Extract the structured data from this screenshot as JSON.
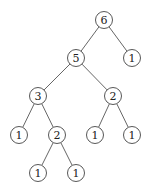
{
  "diagram": {
    "type": "tree",
    "nodes": [
      {
        "id": "n0",
        "label": "6",
        "x": 104,
        "y": 20
      },
      {
        "id": "n1",
        "label": "5",
        "x": 76,
        "y": 58
      },
      {
        "id": "n2",
        "label": "1",
        "x": 132,
        "y": 58
      },
      {
        "id": "n3",
        "label": "3",
        "x": 38,
        "y": 96
      },
      {
        "id": "n4",
        "label": "2",
        "x": 113,
        "y": 96
      },
      {
        "id": "n5",
        "label": "1",
        "x": 19,
        "y": 135
      },
      {
        "id": "n6",
        "label": "2",
        "x": 57,
        "y": 135
      },
      {
        "id": "n7",
        "label": "1",
        "x": 95,
        "y": 135
      },
      {
        "id": "n8",
        "label": "1",
        "x": 132,
        "y": 135
      },
      {
        "id": "n9",
        "label": "1",
        "x": 38,
        "y": 173
      },
      {
        "id": "n10",
        "label": "1",
        "x": 76,
        "y": 173
      }
    ],
    "edges": [
      [
        "n0",
        "n1"
      ],
      [
        "n0",
        "n2"
      ],
      [
        "n1",
        "n3"
      ],
      [
        "n1",
        "n4"
      ],
      [
        "n3",
        "n5"
      ],
      [
        "n3",
        "n6"
      ],
      [
        "n4",
        "n7"
      ],
      [
        "n4",
        "n8"
      ],
      [
        "n6",
        "n9"
      ],
      [
        "n6",
        "n10"
      ]
    ],
    "node_radius": 8.5
  }
}
